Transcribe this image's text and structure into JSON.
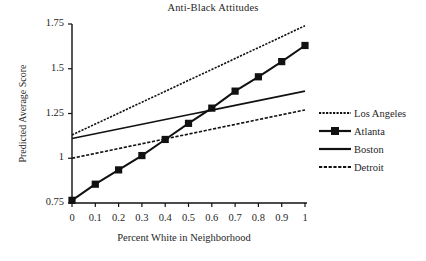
{
  "chart_data": {
    "type": "line",
    "title": "Anti-Black Attitudes",
    "xlabel": "Percent White in Neighborhood",
    "ylabel": "Predicted Average Score",
    "xlim": [
      0,
      1
    ],
    "ylim": [
      0.75,
      1.75
    ],
    "grid": false,
    "legend_position": "right",
    "x": [
      0,
      0.1,
      0.2,
      0.3,
      0.4,
      0.5,
      0.6,
      0.7,
      0.8,
      0.9,
      1
    ],
    "xticklabels": [
      "0",
      "0.1",
      "0.2",
      "0.3",
      "0.4",
      "0.5",
      "0.6",
      "0.7",
      "0.8",
      "0.9",
      "1"
    ],
    "yticks": [
      0.75,
      1,
      1.25,
      1.5,
      1.75
    ],
    "yticklabels": [
      "0.75",
      "1",
      "1.25",
      "1.5",
      "1.75"
    ],
    "series": [
      {
        "name": "Los Angeles",
        "style": "dotted",
        "marker": "none",
        "color": "#111111",
        "values": [
          1.13,
          1.191,
          1.252,
          1.313,
          1.374,
          1.435,
          1.496,
          1.557,
          1.618,
          1.679,
          1.74
        ]
      },
      {
        "name": "Atlanta",
        "style": "solid",
        "marker": "square",
        "color": "#111111",
        "values": [
          0.765,
          0.855,
          0.935,
          1.015,
          1.105,
          1.195,
          1.28,
          1.375,
          1.455,
          1.54,
          1.63
        ]
      },
      {
        "name": "Boston",
        "style": "solid",
        "marker": "none",
        "color": "#111111",
        "values": [
          1.11,
          1.1365,
          1.163,
          1.1895,
          1.216,
          1.2425,
          1.269,
          1.2955,
          1.322,
          1.3485,
          1.375
        ]
      },
      {
        "name": "Detroit",
        "style": "dashed",
        "marker": "none",
        "color": "#111111",
        "values": [
          1.0,
          1.027,
          1.054,
          1.081,
          1.108,
          1.135,
          1.162,
          1.189,
          1.216,
          1.243,
          1.27
        ]
      }
    ]
  },
  "legend": {
    "items": [
      {
        "label": "Los Angeles",
        "style": "dotted"
      },
      {
        "label": "Atlanta",
        "style": "solid-marker"
      },
      {
        "label": "Boston",
        "style": "solid"
      },
      {
        "label": "Detroit",
        "style": "dashed"
      }
    ]
  }
}
